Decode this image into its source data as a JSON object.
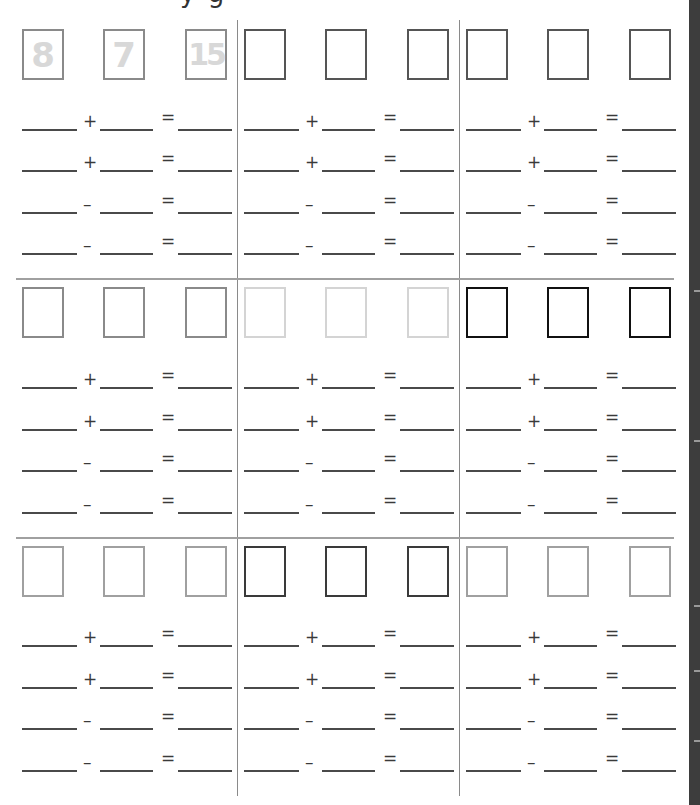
{
  "page": {
    "title_cropped": "y g"
  },
  "sections": [
    {
      "panels": [
        {
          "box_color": "#8a8a8a",
          "box_border": 2,
          "values": [
            "8",
            "7",
            "15"
          ]
        },
        {
          "box_color": "#555555",
          "box_border": 2,
          "values": [
            "",
            "",
            ""
          ]
        },
        {
          "box_color": "#555555",
          "box_border": 2,
          "values": [
            "",
            "",
            ""
          ]
        }
      ]
    },
    {
      "panels": [
        {
          "box_color": "#8a8a8a",
          "box_border": 2,
          "values": [
            "",
            "",
            ""
          ]
        },
        {
          "box_color": "#d4d4d4",
          "box_border": 2,
          "values": [
            "",
            "",
            ""
          ]
        },
        {
          "box_color": "#111111",
          "box_border": 2,
          "values": [
            "",
            "",
            ""
          ]
        }
      ]
    },
    {
      "panels": [
        {
          "box_color": "#a0a0a0",
          "box_border": 2,
          "values": [
            "",
            "",
            ""
          ]
        },
        {
          "box_color": "#3a3a3a",
          "box_border": 2,
          "values": [
            "",
            "",
            ""
          ]
        },
        {
          "box_color": "#a0a0a0",
          "box_border": 2,
          "values": [
            "",
            "",
            ""
          ]
        }
      ]
    }
  ],
  "equation_operators": [
    "+",
    "+",
    "–",
    "–"
  ],
  "equals_sign": "=",
  "colors": {
    "ink": "#4a4a4a",
    "divider": "#8a8a8a",
    "separator": "#a0a0a0",
    "hint_digits": "#d8d8d8",
    "right_strip": "#3d3d3d"
  }
}
